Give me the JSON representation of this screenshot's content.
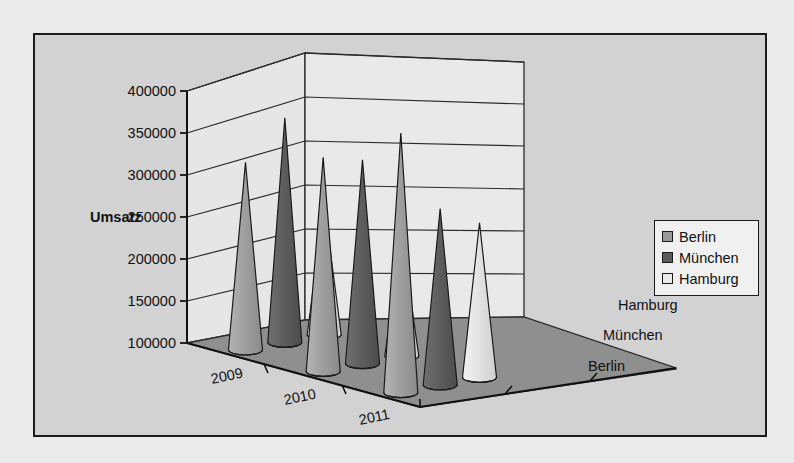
{
  "chart_data": {
    "type": "bar",
    "subtype": "3d-cone",
    "title": "",
    "xlabel": "",
    "ylabel": "Umsatz",
    "zlabel": "",
    "categories": [
      "2009",
      "2010",
      "2011"
    ],
    "depth_categories": [
      "Berlin",
      "München",
      "Hamburg"
    ],
    "ylim": [
      100000,
      400000
    ],
    "yticks": [
      "100000",
      "150000",
      "200000",
      "250000",
      "300000",
      "350000",
      "400000"
    ],
    "ytick_values": [
      100000,
      150000,
      200000,
      250000,
      300000,
      350000,
      400000
    ],
    "grid": true,
    "legend_position": "right",
    "series": [
      {
        "name": "Berlin",
        "color": "#9b9b9b",
        "values": [
          315000,
          321000,
          350000
        ]
      },
      {
        "name": "München",
        "color": "#5c5c5c",
        "values": [
          368000,
          318000,
          260000
        ]
      },
      {
        "name": "Hamburg",
        "color": "#e2e2e2",
        "values": [
          265000,
          225000,
          243000
        ]
      }
    ]
  },
  "axis": {
    "y_title": "Umsatz",
    "ticks": [
      "400000",
      "350000",
      "300000",
      "250000",
      "200000",
      "150000",
      "100000"
    ],
    "x_categories": [
      "2009",
      "2010",
      "2011"
    ],
    "z_categories": [
      "Hamburg",
      "München",
      "Berlin"
    ]
  },
  "legend": {
    "items": [
      {
        "label": "Berlin",
        "color": "#9b9b9b"
      },
      {
        "label": "München",
        "color": "#5c5c5c"
      },
      {
        "label": "Hamburg",
        "color": "#e9e9e9"
      }
    ]
  },
  "colors": {
    "frame_border": "#1b1b1b",
    "plot_background": "#d2d2d2",
    "wall": "#e4e4e4",
    "floor": "#8f8f8f",
    "gridline": "#2a2a2a",
    "text": "#111111"
  }
}
